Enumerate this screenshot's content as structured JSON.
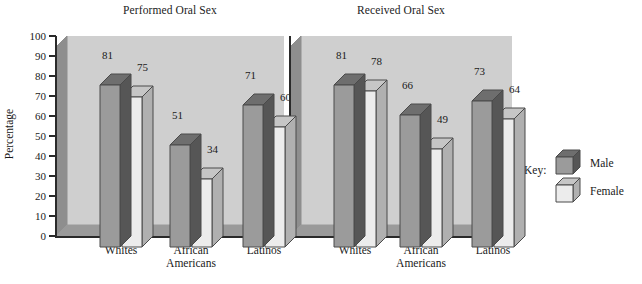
{
  "chart_data": [
    {
      "type": "bar",
      "title": "Performed Oral Sex",
      "xlabel": "",
      "ylabel": "Percentage",
      "ylim": [
        0,
        100
      ],
      "ytick_step": 10,
      "yticks": [
        100,
        90,
        80,
        70,
        60,
        50,
        40,
        30,
        20,
        10,
        0
      ],
      "categories": [
        "Whites",
        "African\nAmericans",
        "Latinos"
      ],
      "grid": false,
      "legend_position": "right-outside",
      "series": [
        {
          "name": "Male",
          "values": [
            81,
            51,
            71
          ],
          "color": "#9b9b9b"
        },
        {
          "name": "Female",
          "values": [
            75,
            34,
            60
          ],
          "color": "#e8e8e8"
        }
      ]
    },
    {
      "type": "bar",
      "title": "Received Oral Sex",
      "xlabel": "",
      "ylabel": "",
      "ylim": [
        0,
        100
      ],
      "ytick_step": 10,
      "yticks": [
        100,
        90,
        80,
        70,
        60,
        50,
        40,
        30,
        20,
        10,
        0
      ],
      "categories": [
        "Whites",
        "African\nAmericans",
        "Latinos"
      ],
      "grid": false,
      "legend_position": "right-outside",
      "series": [
        {
          "name": "Male",
          "values": [
            81,
            66,
            73
          ],
          "color": "#9b9b9b"
        },
        {
          "name": "Female",
          "values": [
            78,
            49,
            64
          ],
          "color": "#e8e8e8"
        }
      ]
    }
  ],
  "legend": {
    "title": "Key:",
    "entries": [
      {
        "label": "Male",
        "swatch": "dark-cube-icon"
      },
      {
        "label": "Female",
        "swatch": "light-cube-icon"
      }
    ]
  },
  "colors": {
    "panel_back": "#cfcfcf",
    "panel_left": "#8e8e8e",
    "panel_floor": "#9a9a9a",
    "bar_male_front": "#9b9b9b",
    "bar_male_top": "#6e6e6e",
    "bar_male_side": "#565656",
    "bar_female_front": "#ececec",
    "bar_female_top": "#c6c6c6",
    "bar_female_side": "#b0b0b0",
    "outline": "#4a4a4a",
    "text": "#1a1a1a"
  }
}
